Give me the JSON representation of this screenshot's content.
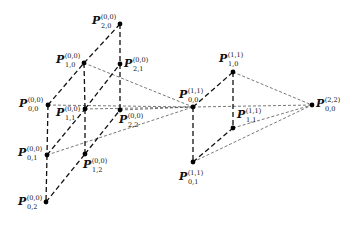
{
  "diagram": {
    "points": [
      {
        "id": "P00_00",
        "sup": "(0,0)",
        "sub": "0,0",
        "x": 48,
        "y": 105,
        "lx": 19,
        "ly": 107
      },
      {
        "id": "P00_10",
        "sup": "(0,0)",
        "sub": "1,0",
        "x": 84,
        "y": 63,
        "lx": 56,
        "ly": 63
      },
      {
        "id": "P00_20",
        "sup": "(0,0)",
        "sub": "2,0",
        "x": 120,
        "y": 24,
        "lx": 92,
        "ly": 24
      },
      {
        "id": "P00_01",
        "sup": "(0,0)",
        "sub": "0,1",
        "x": 47,
        "y": 155,
        "lx": 18,
        "ly": 156
      },
      {
        "id": "P00_11",
        "sup": "(0,0)",
        "sub": "1,1",
        "x": 85,
        "y": 109,
        "lx": 56,
        "ly": 116
      },
      {
        "id": "P00_21",
        "sup": "(0,0)",
        "sub": "2,1",
        "x": 120,
        "y": 64,
        "lx": 124,
        "ly": 67
      },
      {
        "id": "P00_02",
        "sup": "(0,0)",
        "sub": "0,2",
        "x": 46,
        "y": 202,
        "lx": 18,
        "ly": 205
      },
      {
        "id": "P00_12",
        "sup": "(0,0)",
        "sub": "1,2",
        "x": 85,
        "y": 154,
        "lx": 83,
        "ly": 168
      },
      {
        "id": "P00_22",
        "sup": "(0,0)",
        "sub": "2,2",
        "x": 120,
        "y": 110,
        "lx": 119,
        "ly": 123
      },
      {
        "id": "P11_00",
        "sup": "(1,1)",
        "sub": "0,0",
        "x": 193,
        "y": 107,
        "lx": 179,
        "ly": 98
      },
      {
        "id": "P11_10",
        "sup": "(1,1)",
        "sub": "1,0",
        "x": 233,
        "y": 72,
        "lx": 219,
        "ly": 62
      },
      {
        "id": "P11_01",
        "sup": "(1,1)",
        "sub": "0,1",
        "x": 193,
        "y": 162,
        "lx": 179,
        "ly": 180
      },
      {
        "id": "P11_11",
        "sup": "(1,1)",
        "sub": "1,1",
        "x": 233,
        "y": 128,
        "lx": 237,
        "ly": 118
      },
      {
        "id": "P22_00",
        "sup": "(2,2)",
        "sub": "0,0",
        "x": 312,
        "y": 105,
        "lx": 316,
        "ly": 107
      }
    ],
    "base_letter": "P",
    "heavy_edges": [
      [
        "P00_00",
        "P00_10"
      ],
      [
        "P00_10",
        "P00_20"
      ],
      [
        "P00_01",
        "P00_11"
      ],
      [
        "P00_11",
        "P00_21"
      ],
      [
        "P00_02",
        "P00_12"
      ],
      [
        "P00_12",
        "P00_22"
      ],
      [
        "P00_00",
        "P00_01"
      ],
      [
        "P00_01",
        "P00_02"
      ],
      [
        "P00_10",
        "P00_11"
      ],
      [
        "P00_11",
        "P00_12"
      ],
      [
        "P00_20",
        "P00_21"
      ],
      [
        "P00_21",
        "P00_22"
      ],
      [
        "P11_00",
        "P11_10"
      ],
      [
        "P11_01",
        "P11_11"
      ],
      [
        "P11_00",
        "P11_01"
      ],
      [
        "P11_10",
        "P11_11"
      ]
    ],
    "light_edges": [
      [
        "P00_10",
        "P11_00"
      ],
      [
        "P00_00",
        "P11_00"
      ],
      [
        "P00_11",
        "P11_00"
      ],
      [
        "P00_22",
        "P11_00"
      ],
      [
        "P00_01",
        "P11_00"
      ],
      [
        "P11_10",
        "P22_00"
      ],
      [
        "P11_00",
        "P22_00"
      ],
      [
        "P11_11",
        "P22_00"
      ],
      [
        "P11_01",
        "P22_00"
      ]
    ]
  }
}
